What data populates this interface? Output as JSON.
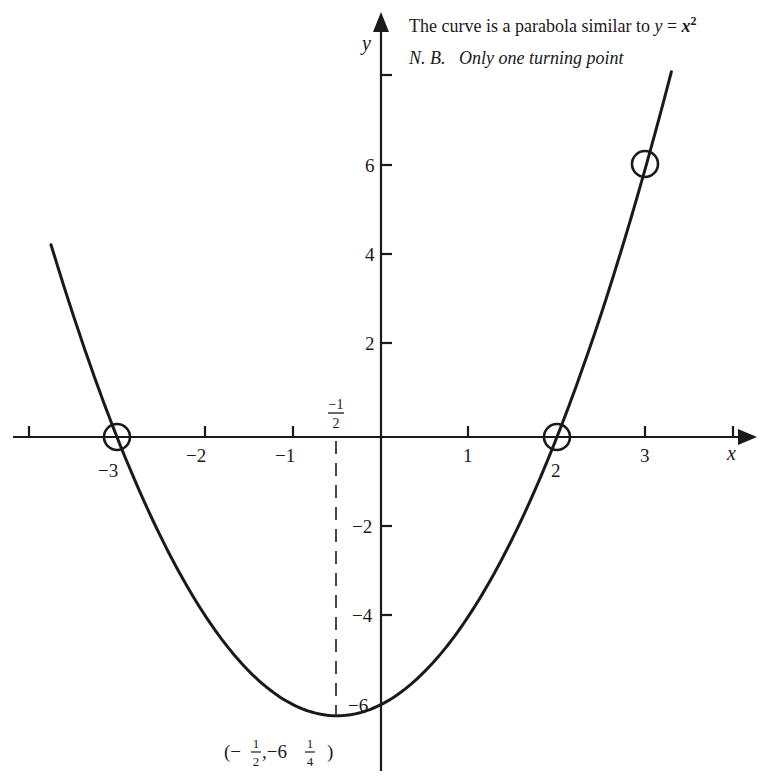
{
  "chart_data": {
    "type": "line",
    "annotations": [
      {
        "text": "The curve is a parabola similar to y = x²",
        "position": "top-right"
      },
      {
        "text": "N. B.   Only one turning point",
        "position": "top-right"
      },
      {
        "text": "(− 1/2 , − 6 1/4 )",
        "position": "below vertex",
        "meaning": "turning point"
      },
      {
        "text": "−1/2",
        "position": "above x-axis at x=-0.5"
      }
    ],
    "xlabel": "x",
    "ylabel": "y",
    "xlim": [
      -4.2,
      4.2
    ],
    "ylim": [
      -7.5,
      9.5
    ],
    "grid": false,
    "x_ticks": [
      -4,
      -3,
      -2,
      -1,
      1,
      2,
      3,
      4
    ],
    "x_tick_labels": [
      "",
      "−3",
      "−2",
      "−1",
      "1",
      "2",
      "3",
      ""
    ],
    "y_ticks": [
      6,
      4,
      2,
      -2,
      -4,
      -6
    ],
    "y_tick_labels": [
      "6",
      "4",
      "2",
      "−2",
      "−4",
      "−6"
    ],
    "series": [
      {
        "name": "y = x² + x − 6",
        "equation": "y = x^2 + x - 6",
        "x": [
          -3.75,
          -3.5,
          -3,
          -2.5,
          -2,
          -1.5,
          -1,
          -0.5,
          0,
          0.5,
          1,
          1.5,
          2,
          2.5,
          3,
          3.3
        ],
        "values": [
          4.31,
          2.75,
          0,
          -2.25,
          -4,
          -5.25,
          -6,
          -6.25,
          -6,
          -5.25,
          -4,
          -2.25,
          0,
          2.75,
          6,
          8.19
        ]
      }
    ],
    "highlighted_points": [
      {
        "x": -3,
        "y": 0,
        "marker": "circle"
      },
      {
        "x": 2,
        "y": 0,
        "marker": "circle"
      },
      {
        "x": 3,
        "y": 6,
        "marker": "circle"
      }
    ],
    "vertex": {
      "x": -0.5,
      "y": -6.25,
      "dashed_line": true
    }
  },
  "labels": {
    "title": "The curve is a parabola similar to ",
    "title_eq_y": "y",
    "title_eq_mid": " = ",
    "title_eq_x": "x",
    "title_eq_sup": "2",
    "note": "N. B.   Only one turning point",
    "x_axis": "x",
    "y_axis": "y",
    "x_ticks": [
      "−3",
      "−2",
      "−1",
      "1",
      "2",
      "3"
    ],
    "y_ticks": [
      "6",
      "4",
      "2",
      "−2",
      "−4",
      "−6"
    ],
    "half_num": "−1",
    "half_den": "2",
    "vertex_open": "(−",
    "vertex_num1": "1",
    "vertex_den1": "2",
    "vertex_mid": ",−6",
    "vertex_num2": "1",
    "vertex_den2": "4",
    "vertex_close": ")"
  },
  "colors": {
    "ink": "#1a1a1a",
    "background": "#ffffff"
  }
}
